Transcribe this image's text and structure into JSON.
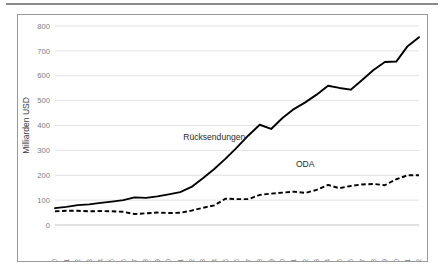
{
  "chart_data": {
    "type": "line",
    "title": "",
    "xlabel": "",
    "ylabel": "Milliarden USD",
    "ylim": [
      0,
      800
    ],
    "yticks": [
      0,
      100,
      200,
      300,
      400,
      500,
      600,
      700,
      800
    ],
    "grid": true,
    "legend_position": "inline-annotations",
    "categories": [
      "1990",
      "1991",
      "1992",
      "1993",
      "1994",
      "1995",
      "1996",
      "1997",
      "1998",
      "1999",
      "2000",
      "2001",
      "2002",
      "2003",
      "2004",
      "2005",
      "2006",
      "2007",
      "2008",
      "2009",
      "2010",
      "2011",
      "2012",
      "2013",
      "2014",
      "2015",
      "2016",
      "2017",
      "2018",
      "2019",
      "2020",
      "2021",
      "2022"
    ],
    "series": [
      {
        "name": "Rücksendungen",
        "style": "solid",
        "color": "#000000",
        "values": [
          68,
          73,
          80,
          83,
          89,
          94,
          100,
          111,
          109,
          115,
          123,
          132,
          153,
          188,
          225,
          267,
          312,
          360,
          403,
          386,
          430,
          466,
          493,
          524,
          560,
          551,
          544,
          583,
          623,
          655,
          657,
          719,
          755
        ]
      },
      {
        "name": "ODA",
        "style": "dashed",
        "color": "#000000",
        "values": [
          55,
          57,
          57,
          55,
          56,
          55,
          53,
          44,
          47,
          50,
          48,
          49,
          58,
          69,
          79,
          106,
          104,
          104,
          121,
          126,
          130,
          134,
          129,
          141,
          161,
          148,
          157,
          163,
          165,
          160,
          184,
          200,
          200
        ]
      }
    ],
    "annotations": [
      {
        "text": "Rücksendungen",
        "x_year": "2004",
        "y_value": 340
      },
      {
        "text": "ODA",
        "x_year": "2012",
        "y_value": 235
      }
    ]
  }
}
